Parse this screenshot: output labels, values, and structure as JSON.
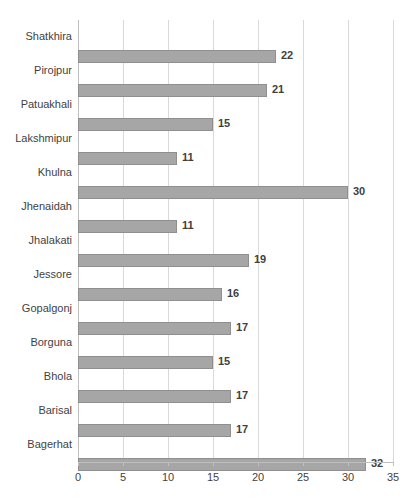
{
  "chart_data": {
    "type": "bar",
    "orientation": "horizontal",
    "title": "",
    "subtitle": "",
    "xlabel": "",
    "ylabel": "",
    "xlim": [
      0,
      35
    ],
    "xticks": [
      0,
      5,
      10,
      15,
      20,
      25,
      30,
      35
    ],
    "grid": true,
    "legend": false,
    "legend_position": "none",
    "categories": [
      "Shatkhira",
      "Pirojpur",
      "Patuakhali",
      "Lakshmipur",
      "Khulna",
      "Jhenaidah",
      "Jhalakati",
      "Jessore",
      "Gopalgonj",
      "Borguna",
      "Bhola",
      "Barisal",
      "Bagerhat"
    ],
    "values": [
      22,
      21,
      15,
      11,
      30,
      11,
      19,
      16,
      17,
      15,
      17,
      17,
      32
    ],
    "data_labels": [
      "22",
      "21",
      "15",
      "11",
      "30",
      "11",
      "19",
      "16",
      "17",
      "15",
      "17",
      "17",
      "32"
    ],
    "tick_labels": [
      "0",
      "5",
      "10",
      "15",
      "20",
      "25",
      "30",
      "35"
    ]
  },
  "style": {
    "bar_fill": "#a6a6a6",
    "bar_border": "#8f8f8f",
    "gridline_color": "#d9d9d9",
    "axis_color": "#bfbfbf",
    "text_color": "#3f3f3f",
    "background": "#ffffff"
  }
}
